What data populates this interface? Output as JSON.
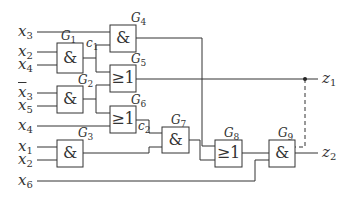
{
  "diagram": {
    "type": "logic-circuit",
    "inputs": [
      {
        "id": "in-x3",
        "var": "x",
        "sub": "3",
        "negated": false
      },
      {
        "id": "in-x2a",
        "var": "x",
        "sub": "2",
        "negated": false
      },
      {
        "id": "in-x4a",
        "var": "x",
        "sub": "4",
        "negated": false
      },
      {
        "id": "in-x3bar",
        "var": "x",
        "sub": "3",
        "negated": true
      },
      {
        "id": "in-x5",
        "var": "x",
        "sub": "5",
        "negated": false
      },
      {
        "id": "in-x4b",
        "var": "x",
        "sub": "4",
        "negated": false
      },
      {
        "id": "in-x1",
        "var": "x",
        "sub": "1",
        "negated": false
      },
      {
        "id": "in-x2b",
        "var": "x",
        "sub": "2",
        "negated": false
      },
      {
        "id": "in-x6",
        "var": "x",
        "sub": "6",
        "negated": false
      }
    ],
    "gates": [
      {
        "id": "G1",
        "name": "G",
        "sub": "1",
        "symbol": "&"
      },
      {
        "id": "G2",
        "name": "G",
        "sub": "2",
        "symbol": "&"
      },
      {
        "id": "G3",
        "name": "G",
        "sub": "3",
        "symbol": "&"
      },
      {
        "id": "G4",
        "name": "G",
        "sub": "4",
        "symbol": "&"
      },
      {
        "id": "G5",
        "name": "G",
        "sub": "5",
        "symbol": "≥1"
      },
      {
        "id": "G6",
        "name": "G",
        "sub": "6",
        "symbol": "≥1"
      },
      {
        "id": "G7",
        "name": "G",
        "sub": "7",
        "symbol": "&"
      },
      {
        "id": "G8",
        "name": "G",
        "sub": "8",
        "symbol": "≥1"
      },
      {
        "id": "G9",
        "name": "G",
        "sub": "9",
        "symbol": "&"
      }
    ],
    "nodes": [
      {
        "id": "c1",
        "var": "c",
        "sub": "1"
      },
      {
        "id": "c2",
        "var": "c",
        "sub": "2"
      }
    ],
    "outputs": [
      {
        "id": "z1",
        "var": "z",
        "sub": "1"
      },
      {
        "id": "z2",
        "var": "z",
        "sub": "2"
      }
    ],
    "connections": [
      "x2,x4 -> G1",
      "x̄3,x5 -> G2",
      "x1,x2 -> G3",
      "x3,c1(G1) -> G4",
      "c1(G1),G2 -> G5",
      "G2,x4 -> G6",
      "c2(G6),G3 -> G7",
      "G4,G7 -> G8",
      "z1(dashed),G8,x6 -> G9",
      "G5 -> z1",
      "G9 -> z2"
    ]
  }
}
